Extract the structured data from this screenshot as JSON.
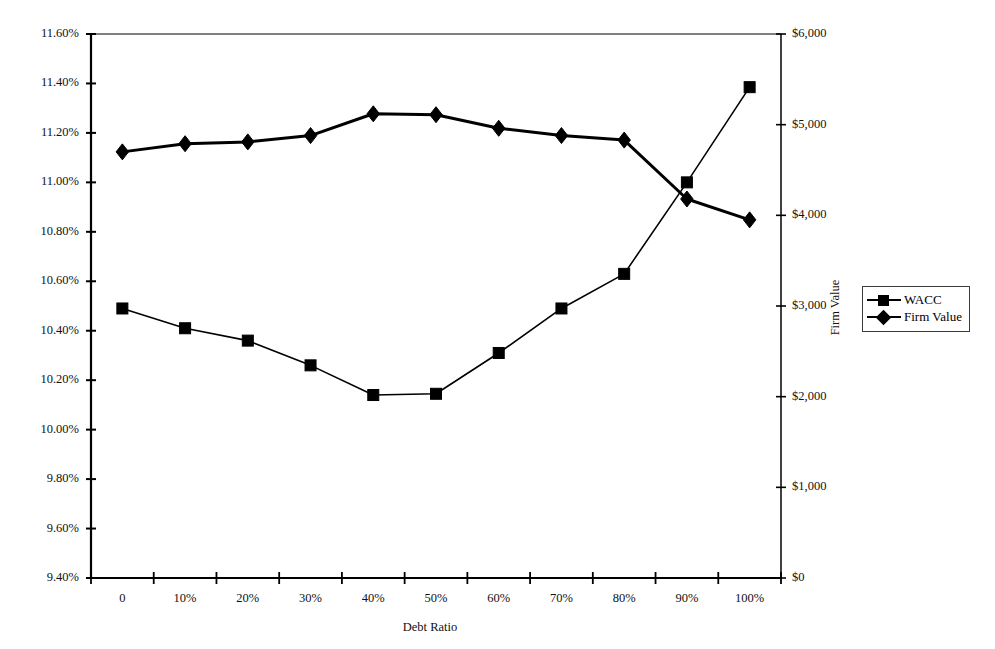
{
  "chart_data": {
    "type": "line",
    "title": "",
    "subtitle": "",
    "xlabel": "Debt Ratio",
    "ylabel": "",
    "y2label": "Firm Value",
    "grid": false,
    "legend_position": "right",
    "categories": [
      "0",
      "10%",
      "20%",
      "30%",
      "40%",
      "50%",
      "60%",
      "70%",
      "80%",
      "90%",
      "100%"
    ],
    "x_tick_labels": [
      "0",
      "10%",
      "20%",
      "30%",
      "40%",
      "50%",
      "60%",
      "70%",
      "80%",
      "90%",
      "100%"
    ],
    "y_tick_labels": [
      "11.60%",
      "11.40%",
      "11.20%",
      "11.00%",
      "10.80%",
      "10.60%",
      "10.40%",
      "10.20%",
      "10.00%",
      "9.80%",
      "9.60%",
      "9.40%"
    ],
    "y2_tick_labels": [
      "$6,000",
      "$5,000",
      "$4,000",
      "$3,000",
      "$2,000",
      "$1,000",
      "$0"
    ],
    "ylim": [
      9.4,
      11.6
    ],
    "y2lim": [
      0,
      6000
    ],
    "y_tick_step": 0.2,
    "y2_tick_step": 1000,
    "series": [
      {
        "name": "WACC",
        "axis": "left",
        "marker": "square",
        "color": "#000000",
        "values": [
          10.49,
          10.41,
          10.36,
          10.26,
          10.14,
          10.145,
          10.31,
          10.49,
          10.63,
          11.0,
          11.385
        ]
      },
      {
        "name": "Firm Value",
        "axis": "right",
        "marker": "diamond",
        "color": "#000000",
        "values": [
          4700,
          4790,
          4810,
          4880,
          5120,
          5110,
          4960,
          4880,
          4830,
          4180,
          3950
        ]
      }
    ]
  },
  "legend": {
    "entries": [
      {
        "label": "WACC",
        "marker": "square"
      },
      {
        "label": "Firm Value",
        "marker": "diamond"
      }
    ]
  },
  "axis_titles": {
    "x": "Debt Ratio",
    "y_right": "Firm Value"
  }
}
